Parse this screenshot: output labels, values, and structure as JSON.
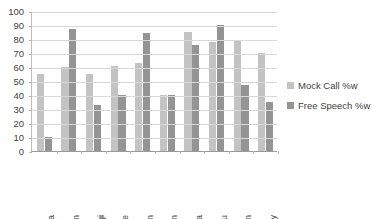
{
  "chart_data": {
    "type": "bar",
    "title": "",
    "subtitle": "",
    "xlabel": "",
    "ylabel": "",
    "ylim": [
      0,
      100
    ],
    "ytick_step": 10,
    "yticks": [
      "100",
      "90",
      "80",
      "70",
      "60",
      "50",
      "40",
      "30",
      "20",
      "10",
      "0"
    ],
    "grid": true,
    "legend_position": "right",
    "categories": [
      "Akshata",
      "Ashwin",
      "Gargi",
      "Jasmine",
      "Kartikeyan",
      "Kiran",
      "Ravindra",
      "Sanju",
      "Sharan",
      "Vijay"
    ],
    "series": [
      {
        "name": "Mock Call %w",
        "color": "#c3c3c3",
        "values": [
          55,
          60,
          55,
          61,
          63,
          40,
          85,
          78,
          79,
          70
        ]
      },
      {
        "name": "Free Speech %w",
        "color": "#949494",
        "values": [
          10,
          87,
          33,
          40,
          84,
          40,
          76,
          90,
          47,
          35
        ]
      }
    ]
  },
  "legend": {
    "items": [
      {
        "label": "Mock Call %w"
      },
      {
        "label": "Free Speech %w"
      }
    ]
  },
  "colors": {
    "series_1": "#c3c3c3",
    "series_2": "#949494",
    "gridline": "#d8d8d8",
    "axis": "#9a9a9a",
    "text": "#3f3f3f",
    "background": "#ffffff"
  }
}
